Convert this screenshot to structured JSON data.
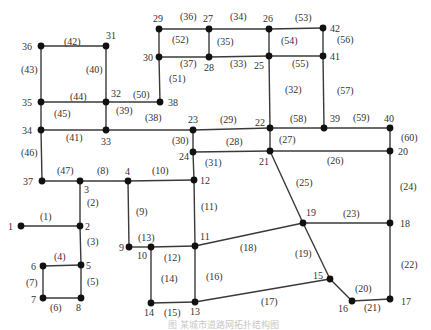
{
  "diagram": {
    "type": "road-network-topology",
    "caption": "图 某城市道路网拓扑结构图",
    "colors": {
      "edge": "#3a3a3a",
      "node": "#111111",
      "text": "#333333"
    },
    "nodes": [
      {
        "id": "1",
        "x": 21,
        "y": 226,
        "lx": 8,
        "ly": 230
      },
      {
        "id": "2",
        "x": 80,
        "y": 226,
        "lx": 85,
        "ly": 230
      },
      {
        "id": "3",
        "x": 80,
        "y": 181,
        "lx": 84,
        "ly": 193
      },
      {
        "id": "4",
        "x": 128,
        "y": 181,
        "lx": 125,
        "ly": 175
      },
      {
        "id": "5",
        "x": 81,
        "y": 265,
        "lx": 86,
        "ly": 269
      },
      {
        "id": "6",
        "x": 43,
        "y": 266,
        "lx": 31,
        "ly": 270
      },
      {
        "id": "7",
        "x": 43,
        "y": 298,
        "lx": 31,
        "ly": 303
      },
      {
        "id": "8",
        "x": 81,
        "y": 298,
        "lx": 76,
        "ly": 311
      },
      {
        "id": "9",
        "x": 129,
        "y": 247,
        "lx": 119,
        "ly": 251
      },
      {
        "id": "10",
        "x": 151,
        "y": 247,
        "lx": 137,
        "ly": 259
      },
      {
        "id": "11",
        "x": 195,
        "y": 246,
        "lx": 200,
        "ly": 240
      },
      {
        "id": "12",
        "x": 194,
        "y": 180,
        "lx": 200,
        "ly": 184
      },
      {
        "id": "13",
        "x": 195,
        "y": 302,
        "lx": 190,
        "ly": 315
      },
      {
        "id": "14",
        "x": 151,
        "y": 303,
        "lx": 144,
        "ly": 316
      },
      {
        "id": "15",
        "x": 330,
        "y": 279,
        "lx": 313,
        "ly": 279
      },
      {
        "id": "16",
        "x": 352,
        "y": 301,
        "lx": 338,
        "ly": 312
      },
      {
        "id": "17",
        "x": 390,
        "y": 299,
        "lx": 401,
        "ly": 305
      },
      {
        "id": "18",
        "x": 390,
        "y": 223,
        "lx": 400,
        "ly": 227
      },
      {
        "id": "19",
        "x": 303,
        "y": 223,
        "lx": 306,
        "ly": 216
      },
      {
        "id": "20",
        "x": 390,
        "y": 151,
        "lx": 398,
        "ly": 155
      },
      {
        "id": "21",
        "x": 270,
        "y": 151,
        "lx": 259,
        "ly": 165
      },
      {
        "id": "22",
        "x": 270,
        "y": 128,
        "lx": 255,
        "ly": 126
      },
      {
        "id": "23",
        "x": 193,
        "y": 130,
        "lx": 188,
        "ly": 123
      },
      {
        "id": "24",
        "x": 193,
        "y": 152,
        "lx": 179,
        "ly": 160
      },
      {
        "id": "25",
        "x": 269,
        "y": 56,
        "lx": 254,
        "ly": 69
      },
      {
        "id": "26",
        "x": 269,
        "y": 29,
        "lx": 263,
        "ly": 22
      },
      {
        "id": "27",
        "x": 209,
        "y": 29,
        "lx": 203,
        "ly": 22
      },
      {
        "id": "28",
        "x": 209,
        "y": 57,
        "lx": 204,
        "ly": 71
      },
      {
        "id": "29",
        "x": 159,
        "y": 29,
        "lx": 153,
        "ly": 22
      },
      {
        "id": "30",
        "x": 159,
        "y": 57,
        "lx": 143,
        "ly": 61
      },
      {
        "id": "31",
        "x": 106,
        "y": 46,
        "lx": 106,
        "ly": 39
      },
      {
        "id": "32",
        "x": 106,
        "y": 102,
        "lx": 111,
        "ly": 97
      },
      {
        "id": "33",
        "x": 106,
        "y": 130,
        "lx": 101,
        "ly": 145
      },
      {
        "id": "34",
        "x": 41,
        "y": 130,
        "lx": 22,
        "ly": 134
      },
      {
        "id": "35",
        "x": 41,
        "y": 102,
        "lx": 22,
        "ly": 106
      },
      {
        "id": "36",
        "x": 41,
        "y": 46,
        "lx": 22,
        "ly": 50
      },
      {
        "id": "37",
        "x": 42,
        "y": 181,
        "lx": 23,
        "ly": 185
      },
      {
        "id": "38",
        "x": 160,
        "y": 102,
        "lx": 168,
        "ly": 106
      },
      {
        "id": "39",
        "x": 324,
        "y": 128,
        "lx": 330,
        "ly": 122
      },
      {
        "id": "40",
        "x": 390,
        "y": 128,
        "lx": 384,
        "ly": 122
      },
      {
        "id": "41",
        "x": 323,
        "y": 56,
        "lx": 330,
        "ly": 60
      },
      {
        "id": "42",
        "x": 323,
        "y": 28,
        "lx": 330,
        "ly": 32
      }
    ],
    "edges": [
      {
        "id": "(1)",
        "from": "1",
        "to": "2",
        "lx": 40,
        "ly": 220
      },
      {
        "id": "(2)",
        "from": "3",
        "to": "2",
        "lx": 87,
        "ly": 206
      },
      {
        "id": "(3)",
        "from": "2",
        "to": "5",
        "lx": 87,
        "ly": 245
      },
      {
        "id": "(4)",
        "from": "6",
        "to": "5",
        "lx": 54,
        "ly": 260
      },
      {
        "id": "(5)",
        "from": "5",
        "to": "8",
        "lx": 87,
        "ly": 285
      },
      {
        "id": "(6)",
        "from": "7",
        "to": "8",
        "lx": 50,
        "ly": 311
      },
      {
        "id": "(7)",
        "from": "6",
        "to": "7",
        "lx": 26,
        "ly": 286
      },
      {
        "id": "(8)",
        "from": "3",
        "to": "4",
        "lx": 97,
        "ly": 174
      },
      {
        "id": "(9)",
        "from": "4",
        "to": "9",
        "lx": 136,
        "ly": 215
      },
      {
        "id": "(10)",
        "from": "4",
        "to": "12",
        "lx": 152,
        "ly": 174
      },
      {
        "id": "(11)",
        "from": "12",
        "to": "11",
        "lx": 201,
        "ly": 210
      },
      {
        "id": "(12)",
        "from": "10",
        "to": "11",
        "lx": 164,
        "ly": 261
      },
      {
        "id": "(13)",
        "from": "9",
        "to": "10",
        "lx": 138,
        "ly": 241
      },
      {
        "id": "(14)",
        "from": "10",
        "to": "14",
        "lx": 161,
        "ly": 282
      },
      {
        "id": "(15)",
        "from": "14",
        "to": "13",
        "lx": 164,
        "ly": 316
      },
      {
        "id": "(16)",
        "from": "11",
        "to": "13",
        "lx": 206,
        "ly": 280
      },
      {
        "id": "(17)",
        "from": "13",
        "to": "15",
        "lx": 261,
        "ly": 305
      },
      {
        "id": "(18)",
        "from": "11",
        "to": "19",
        "lx": 240,
        "ly": 251
      },
      {
        "id": "(19)",
        "from": "19",
        "to": "15",
        "lx": 295,
        "ly": 257
      },
      {
        "id": "(20)",
        "from": "15",
        "to": "16",
        "lx": 355,
        "ly": 292
      },
      {
        "id": "(21)",
        "from": "16",
        "to": "17",
        "lx": 364,
        "ly": 311
      },
      {
        "id": "(22)",
        "from": "18",
        "to": "17",
        "lx": 401,
        "ly": 268
      },
      {
        "id": "(23)",
        "from": "19",
        "to": "18",
        "lx": 343,
        "ly": 217
      },
      {
        "id": "(24)",
        "from": "20",
        "to": "18",
        "lx": 400,
        "ly": 190
      },
      {
        "id": "(25)",
        "from": "21",
        "to": "19",
        "lx": 296,
        "ly": 186
      },
      {
        "id": "(26)",
        "from": "21",
        "to": "20",
        "lx": 327,
        "ly": 164
      },
      {
        "id": "(27)",
        "from": "22",
        "to": "21",
        "lx": 279,
        "ly": 143
      },
      {
        "id": "(28)",
        "from": "24",
        "to": "21",
        "lx": 226,
        "ly": 145
      },
      {
        "id": "(29)",
        "from": "23",
        "to": "22",
        "lx": 220,
        "ly": 123
      },
      {
        "id": "(30)",
        "from": "23",
        "to": "24",
        "lx": 172,
        "ly": 144
      },
      {
        "id": "(31)",
        "from": "24",
        "to": "12",
        "lx": 205,
        "ly": 166
      },
      {
        "id": "(32)",
        "from": "25",
        "to": "22",
        "lx": 285,
        "ly": 93
      },
      {
        "id": "(33)",
        "from": "28",
        "to": "25",
        "lx": 230,
        "ly": 67
      },
      {
        "id": "(34)",
        "from": "27",
        "to": "26",
        "lx": 230,
        "ly": 20
      },
      {
        "id": "(35)",
        "from": "27",
        "to": "28",
        "lx": 217,
        "ly": 45
      },
      {
        "id": "(36)",
        "from": "29",
        "to": "27",
        "lx": 180,
        "ly": 20
      },
      {
        "id": "(37)",
        "from": "30",
        "to": "28",
        "lx": 180,
        "ly": 67
      },
      {
        "id": "(38)",
        "from": "33",
        "to": "23",
        "lx": 145,
        "ly": 121
      },
      {
        "id": "(39)",
        "from": "32",
        "to": "33",
        "lx": 116,
        "ly": 114
      },
      {
        "id": "(40)",
        "from": "31",
        "to": "32",
        "lx": 86,
        "ly": 73
      },
      {
        "id": "(41)",
        "from": "34",
        "to": "33",
        "lx": 66,
        "ly": 141
      },
      {
        "id": "(42)",
        "from": "36",
        "to": "31",
        "lx": 64,
        "ly": 45
      },
      {
        "id": "(43)",
        "from": "36",
        "to": "35",
        "lx": 21,
        "ly": 73
      },
      {
        "id": "(44)",
        "from": "35",
        "to": "32",
        "lx": 70,
        "ly": 100
      },
      {
        "id": "(45)",
        "from": "35",
        "to": "34",
        "lx": 54,
        "ly": 117
      },
      {
        "id": "(46)",
        "from": "34",
        "to": "37",
        "lx": 21,
        "ly": 156
      },
      {
        "id": "(47)",
        "from": "37",
        "to": "3",
        "lx": 57,
        "ly": 174
      },
      {
        "id": "(48)",
        "from": "8",
        "to": "43",
        "lx": 92,
        "ly": 310
      },
      {
        "id": "(49)",
        "from": "9",
        "to": "43",
        "lx": 107,
        "ly": 275
      },
      {
        "id": "(50)",
        "from": "32",
        "to": "38",
        "lx": 133,
        "ly": 98
      },
      {
        "id": "(51)",
        "from": "30",
        "to": "38",
        "lx": 169,
        "ly": 82
      },
      {
        "id": "(52)",
        "from": "29",
        "to": "30",
        "lx": 172,
        "ly": 43
      },
      {
        "id": "(53)",
        "from": "26",
        "to": "42",
        "lx": 295,
        "ly": 21
      },
      {
        "id": "(54)",
        "from": "26",
        "to": "25",
        "lx": 281,
        "ly": 44
      },
      {
        "id": "(55)",
        "from": "25",
        "to": "41",
        "lx": 292,
        "ly": 67
      },
      {
        "id": "(56)",
        "from": "42",
        "to": "41",
        "lx": 337,
        "ly": 43
      },
      {
        "id": "(57)",
        "from": "41",
        "to": "39",
        "lx": 337,
        "ly": 94
      },
      {
        "id": "(58)",
        "from": "22",
        "to": "39",
        "lx": 290,
        "ly": 122
      },
      {
        "id": "(59)",
        "from": "39",
        "to": "40",
        "lx": 353,
        "ly": 121
      },
      {
        "id": "(60)",
        "from": "40",
        "to": "20",
        "lx": 401,
        "ly": 141
      }
    ]
  }
}
